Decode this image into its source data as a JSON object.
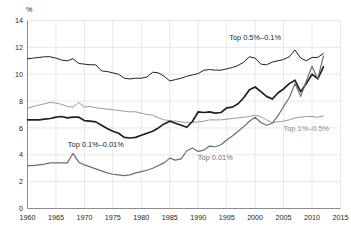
{
  "chart_data": {
    "type": "line",
    "title": "",
    "subtitle": "",
    "xlabel": "",
    "ylabel": "%",
    "ylim": [
      0,
      14
    ],
    "xlim": [
      1960,
      2015
    ],
    "yticks": [
      "0",
      "2",
      "4",
      "6",
      "8",
      "10",
      "12",
      "14"
    ],
    "xticks": [
      "1960",
      "1965",
      "1970",
      "1975",
      "1980",
      "1985",
      "1990",
      "1995",
      "2000",
      "2005",
      "2010",
      "2015"
    ],
    "grid": true,
    "legend_position": "inline-annotations",
    "x": [
      1960,
      1961,
      1962,
      1963,
      1964,
      1965,
      1966,
      1967,
      1968,
      1969,
      1970,
      1971,
      1972,
      1973,
      1974,
      1975,
      1976,
      1977,
      1978,
      1979,
      1980,
      1981,
      1982,
      1983,
      1984,
      1985,
      1986,
      1987,
      1988,
      1989,
      1990,
      1991,
      1992,
      1993,
      1994,
      1995,
      1996,
      1997,
      1998,
      1999,
      2000,
      2001,
      2002,
      2003,
      2004,
      2005,
      2006,
      2007,
      2008,
      2009,
      2010,
      2011,
      2012
    ],
    "series": [
      {
        "name": "Top 0.5%-0.1%",
        "label": "Top 0.5%–0.1%",
        "color": "#231f20",
        "width": 1.0,
        "label_x": 2000,
        "label_y": 12.55,
        "label_anchor": "middle",
        "values": [
          11.15,
          11.2,
          11.25,
          11.3,
          11.3,
          11.2,
          11.05,
          11.0,
          11.15,
          10.8,
          10.75,
          10.7,
          10.7,
          10.25,
          10.2,
          10.1,
          10.0,
          9.7,
          9.65,
          9.7,
          9.7,
          9.8,
          10.15,
          10.1,
          9.85,
          9.5,
          9.6,
          9.7,
          9.85,
          9.95,
          10.05,
          10.3,
          10.35,
          10.3,
          10.3,
          10.4,
          10.5,
          10.65,
          10.9,
          11.3,
          11.2,
          10.75,
          10.7,
          10.9,
          11.0,
          11.1,
          11.3,
          11.8,
          11.2,
          11.0,
          11.25,
          11.25,
          11.55
        ]
      },
      {
        "name": "Top 1%-0.5%",
        "label": "Top 1%–0.5%",
        "color": "#8d8d8d",
        "width": 0.9,
        "label_x": 2009,
        "label_y": 5.75,
        "label_anchor": "middle",
        "values": [
          7.45,
          7.6,
          7.7,
          7.8,
          7.9,
          7.85,
          7.75,
          7.6,
          7.55,
          7.9,
          7.55,
          7.6,
          7.5,
          7.45,
          7.4,
          7.35,
          7.3,
          7.25,
          7.2,
          7.2,
          7.1,
          7.0,
          6.95,
          6.75,
          6.6,
          6.55,
          6.5,
          6.45,
          6.4,
          6.4,
          6.45,
          6.5,
          6.6,
          6.6,
          6.6,
          6.65,
          6.7,
          6.75,
          6.8,
          6.85,
          6.95,
          6.85,
          6.6,
          6.4,
          6.45,
          6.5,
          6.6,
          6.75,
          6.8,
          6.85,
          6.85,
          6.8,
          6.9
        ]
      },
      {
        "name": "Top 0.1%-0.01%",
        "label": "Top 0.1%–0.01%",
        "color": "#231f20",
        "width": 1.7,
        "label_x": 1972,
        "label_y": 4.55,
        "label_anchor": "middle",
        "values": [
          6.6,
          6.6,
          6.6,
          6.65,
          6.7,
          6.8,
          6.85,
          6.75,
          6.8,
          6.8,
          6.55,
          6.5,
          6.45,
          6.2,
          5.95,
          5.75,
          5.6,
          5.3,
          5.25,
          5.3,
          5.45,
          5.6,
          5.75,
          6.0,
          6.3,
          6.5,
          6.35,
          6.2,
          6.05,
          6.5,
          7.2,
          7.15,
          7.2,
          7.1,
          7.15,
          7.5,
          7.55,
          7.8,
          8.25,
          8.85,
          9.05,
          8.7,
          8.35,
          8.15,
          8.6,
          8.9,
          9.3,
          9.55,
          8.7,
          9.3,
          10.0,
          9.65,
          10.55
        ]
      },
      {
        "name": "Top 0.01%",
        "label": "Top 0.01%",
        "color": "#6e6e6e",
        "width": 1.2,
        "label_x": 1993,
        "label_y": 3.6,
        "label_anchor": "middle",
        "values": [
          3.2,
          3.2,
          3.25,
          3.3,
          3.4,
          3.4,
          3.4,
          3.4,
          4.1,
          3.45,
          3.25,
          3.1,
          2.95,
          2.8,
          2.65,
          2.55,
          2.5,
          2.45,
          2.5,
          2.65,
          2.75,
          2.85,
          3.0,
          3.2,
          3.4,
          3.75,
          3.6,
          3.7,
          4.3,
          4.5,
          4.25,
          4.35,
          4.65,
          4.6,
          4.75,
          5.1,
          5.4,
          5.75,
          6.1,
          6.5,
          6.8,
          6.4,
          6.2,
          6.35,
          6.9,
          7.6,
          8.25,
          9.3,
          8.35,
          9.5,
          10.6,
          9.65,
          11.35
        ]
      }
    ]
  }
}
